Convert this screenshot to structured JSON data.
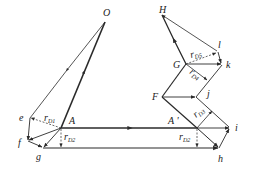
{
  "diagram": {
    "type": "velocity polygon / vector diagram",
    "colors": {
      "line": "#2a2a2a",
      "dashed": "#444444",
      "background": "#ffffff"
    },
    "points": {
      "O": {
        "label": "O",
        "x": 105,
        "y": 22
      },
      "A": {
        "label": "A",
        "x": 61,
        "y": 128
      },
      "A_prime": {
        "label": "A '",
        "x": 197,
        "y": 128
      },
      "e": {
        "label": "e",
        "x": 30,
        "y": 118
      },
      "f": {
        "label": "f",
        "x": 28,
        "y": 141
      },
      "g": {
        "label": "g",
        "x": 43,
        "y": 148
      },
      "h": {
        "label": "h",
        "x": 219,
        "y": 148
      },
      "i": {
        "label": "i",
        "x": 230,
        "y": 128
      },
      "F": {
        "label": "F",
        "x": 162,
        "y": 97
      },
      "j": {
        "label": "j",
        "x": 196,
        "y": 97
      },
      "G": {
        "label": "G",
        "x": 186,
        "y": 64
      },
      "k": {
        "label": "k",
        "x": 222,
        "y": 64
      },
      "l": {
        "label": "l",
        "x": 218,
        "y": 52
      },
      "H": {
        "label": "H",
        "x": 162,
        "y": 15
      }
    },
    "radius_labels": {
      "rD1": {
        "main": "r",
        "sub": "D1"
      },
      "rD2_left": {
        "main": "r",
        "sub": "D2"
      },
      "rD2_right": {
        "main": "r",
        "sub": "D2"
      },
      "rD3": {
        "main": "r",
        "sub": "D3"
      },
      "rD4": {
        "main": "r",
        "sub": "D4"
      },
      "rD5": {
        "main": "r",
        "sub": "D5"
      }
    }
  }
}
